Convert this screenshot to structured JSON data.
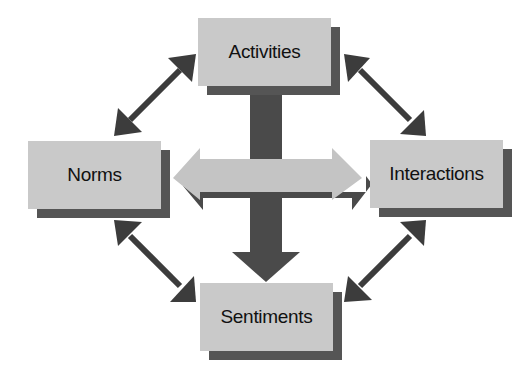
{
  "diagram": {
    "nodes": {
      "top": {
        "label": "Activities"
      },
      "left": {
        "label": "Norms"
      },
      "right": {
        "label": "Interactions"
      },
      "bottom": {
        "label": "Sentiments"
      }
    },
    "connectors": [
      {
        "from": "Activities",
        "to": "Norms",
        "type": "bidirectional"
      },
      {
        "from": "Activities",
        "to": "Interactions",
        "type": "bidirectional"
      },
      {
        "from": "Norms",
        "to": "Sentiments",
        "type": "bidirectional"
      },
      {
        "from": "Interactions",
        "to": "Sentiments",
        "type": "bidirectional"
      },
      {
        "from": "Activities",
        "to": "Sentiments",
        "type": "unidirectional"
      },
      {
        "from": "Norms",
        "to": "Interactions",
        "type": "bidirectional"
      }
    ],
    "colors": {
      "box": "#c9c9c9",
      "shadow": "#555555",
      "dark_arrow": "#4a4a4a",
      "light_arrow": "#c4c4c4"
    }
  }
}
